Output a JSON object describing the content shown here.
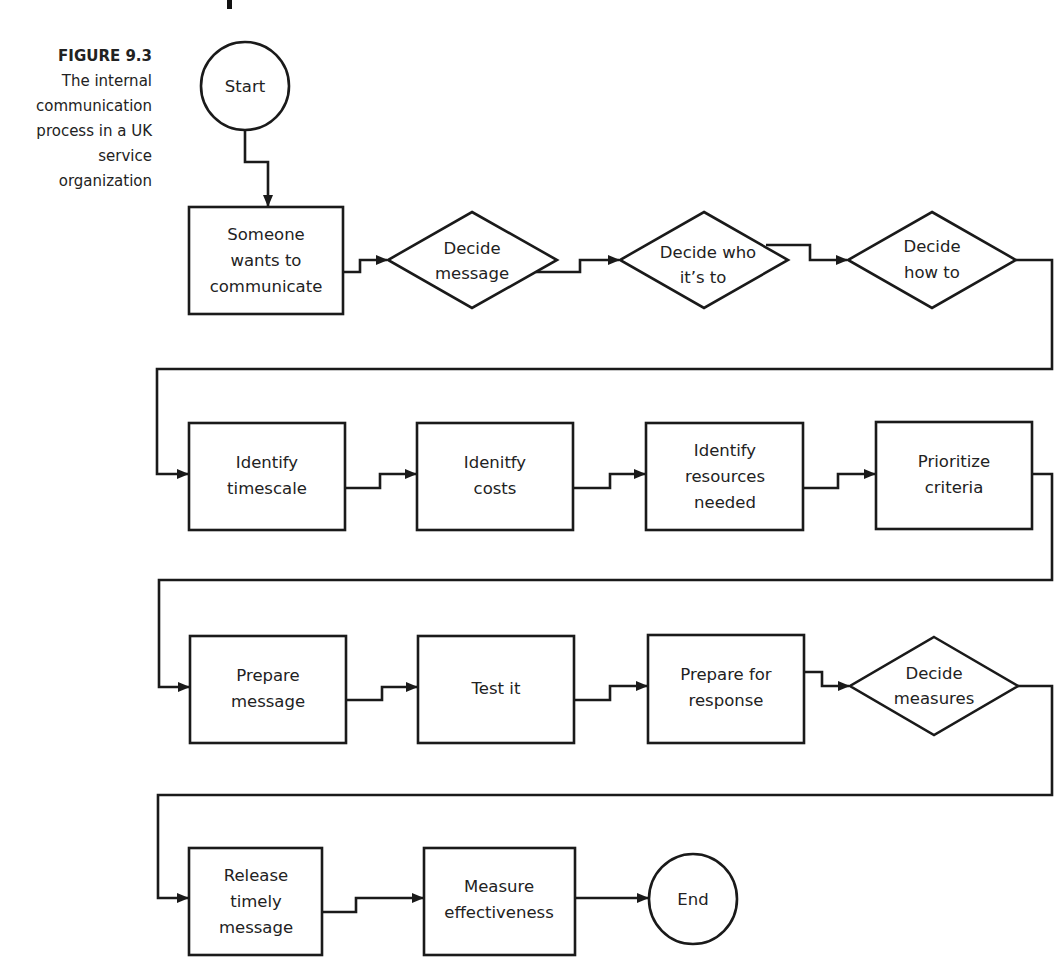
{
  "figure": {
    "label": "FIGURE 9.3",
    "caption_lines": [
      "The internal",
      "communication",
      "process in a UK",
      "service",
      "organization"
    ]
  },
  "nodes": {
    "start": {
      "type": "terminator",
      "lines": [
        "Start"
      ]
    },
    "someone_wants": {
      "type": "process",
      "lines": [
        "Someone",
        "wants to",
        "communicate"
      ]
    },
    "decide_message": {
      "type": "decision",
      "lines": [
        "Decide",
        "message"
      ]
    },
    "decide_who": {
      "type": "decision",
      "lines": [
        "Decide who",
        "it’s to"
      ]
    },
    "decide_how": {
      "type": "decision",
      "lines": [
        "Decide",
        "how to"
      ]
    },
    "identify_timescale": {
      "type": "process",
      "lines": [
        "Identify",
        "timescale"
      ]
    },
    "identify_costs": {
      "type": "process",
      "lines": [
        "Idenitfy",
        "costs"
      ]
    },
    "identify_resources": {
      "type": "process",
      "lines": [
        "Identify",
        "resources",
        "needed"
      ]
    },
    "prioritize_criteria": {
      "type": "process",
      "lines": [
        "Prioritize",
        "criteria"
      ]
    },
    "prepare_message": {
      "type": "process",
      "lines": [
        "Prepare",
        "message"
      ]
    },
    "test_it": {
      "type": "process",
      "lines": [
        "Test it"
      ]
    },
    "prepare_response": {
      "type": "process",
      "lines": [
        "Prepare for",
        "response"
      ]
    },
    "decide_measures": {
      "type": "decision",
      "lines": [
        "Decide",
        "measures"
      ]
    },
    "release_message": {
      "type": "process",
      "lines": [
        "Release",
        "timely",
        "message"
      ]
    },
    "measure_effectiveness": {
      "type": "process",
      "lines": [
        "Measure",
        "effectiveness"
      ]
    },
    "end": {
      "type": "terminator",
      "lines": [
        "End"
      ]
    }
  },
  "flow_order": [
    "Start",
    "Someone wants to communicate",
    "Decide message",
    "Decide who it’s to",
    "Decide how to",
    "Identify timescale",
    "Idenitfy costs",
    "Identify resources needed",
    "Prioritize criteria",
    "Prepare message",
    "Test it",
    "Prepare for response",
    "Decide measures",
    "Release timely message",
    "Measure effectiveness",
    "End"
  ],
  "colors": {
    "line": "#1a1a1a",
    "text": "#222222",
    "background": "#ffffff"
  }
}
